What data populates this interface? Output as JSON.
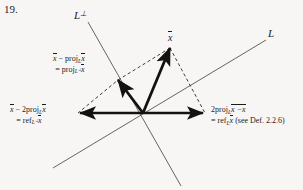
{
  "figure": {
    "exercise_number": "19.",
    "type": "vector-reflection-projection-diagram",
    "axes": [
      {
        "name": "L-perp",
        "label": "L",
        "superscript": "⊥"
      },
      {
        "name": "L",
        "label": "L",
        "superscript": ""
      }
    ],
    "vectors": {
      "x": {
        "label": "x",
        "overbar": true
      },
      "proj_perp": {
        "line1_prefix": "x",
        "line1_op": " − proj",
        "line1_sub": "L",
        "line1_suffix": "x",
        "line2_eq": "= proj",
        "line2_sub": "L",
        "line2_sub_sup": "⊥",
        "line2_suffix": "x"
      },
      "ref_perp": {
        "line1_prefix": "x",
        "line1_op": " − 2proj",
        "line1_sub": "L",
        "line1_suffix": "x",
        "line2_eq": "= ref",
        "line2_sub": "L",
        "line2_sub_sup": "⊥",
        "line2_suffix": "x"
      },
      "ref_L": {
        "line1_prefix": "2proj",
        "line1_sub": "L",
        "line1_mid": "x − ",
        "line1_suffix": "x",
        "line2_eq": "= ref",
        "line2_sub": "L",
        "line2_suffix": "x",
        "line2_note": " (see Def. 2.2.6)"
      }
    },
    "geometry": {
      "origin": [
        143,
        113
      ],
      "x_tip": [
        170,
        48
      ],
      "proj_perp_tip": [
        118,
        80
      ],
      "ref_perp_tip": [
        78,
        113
      ],
      "ref_L_tip": [
        205,
        113
      ],
      "L_line": [
        [
          53,
          168
        ],
        [
          266,
          40
        ]
      ],
      "L_perp_line": [
        [
          88,
          22
        ],
        [
          181,
          186
        ]
      ]
    },
    "colors": {
      "ink": "#1b1b1b",
      "thin_line": "#55524f",
      "paper": "#f7f6f4"
    }
  }
}
